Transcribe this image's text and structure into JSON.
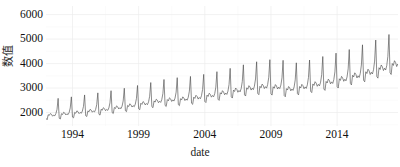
{
  "chart_data": {
    "type": "line",
    "title": "",
    "xlabel": "date",
    "ylabel": "数值",
    "xlim": [
      1992.0,
      2018.6
    ],
    "ylim": [
      1450,
      6350
    ],
    "grid": true,
    "legend": false,
    "legend_position": "none",
    "x_ticks": [
      "1994",
      "1999",
      "2004",
      "2009",
      "2014"
    ],
    "x_tick_values": [
      1994,
      1999,
      2004,
      2009,
      2014
    ],
    "y_ticks": [
      "2000",
      "3000",
      "4000",
      "5000",
      "6000"
    ],
    "y_tick_values": [
      2000,
      3000,
      4000,
      5000,
      6000
    ],
    "series": [
      {
        "name": "value",
        "color": "#4d4d4d",
        "x_start": 1992.0,
        "x_step": 0.08333333,
        "values": [
          1759,
          1706,
          1909,
          1887,
          1958,
          1925,
          1849,
          1896,
          1866,
          1960,
          2131,
          2579,
          1767,
          1736,
          1952,
          1917,
          2011,
          1979,
          1901,
          1948,
          1914,
          2005,
          2189,
          2640,
          1814,
          1784,
          2006,
          1970,
          2068,
          2036,
          1955,
          2004,
          1968,
          2062,
          2253,
          2718,
          1871,
          1839,
          2068,
          2030,
          2131,
          2096,
          2013,
          2064,
          2026,
          2123,
          2322,
          2803,
          1930,
          1896,
          2133,
          2093,
          2197,
          2160,
          2074,
          2127,
          2087,
          2188,
          2394,
          2892,
          1997,
          1961,
          2206,
          2165,
          2272,
          2233,
          2144,
          2199,
          2157,
          2262,
          2476,
          2992,
          2073,
          2035,
          2290,
          2246,
          2357,
          2317,
          2224,
          2281,
          2237,
          2346,
          2568,
          3105,
          2154,
          2114,
          2379,
          2333,
          2448,
          2406,
          2309,
          2368,
          2322,
          2435,
          2666,
          3224,
          2240,
          2198,
          2474,
          2426,
          2545,
          2501,
          2400,
          2461,
          2413,
          2530,
          2770,
          3350,
          2289,
          2247,
          2529,
          2480,
          2602,
          2557,
          2453,
          2516,
          2467,
          2586,
          2832,
          3424,
          2323,
          2280,
          2566,
          2517,
          2641,
          2595,
          2489,
          2553,
          2503,
          2624,
          2874,
          3474,
          2379,
          2335,
          2628,
          2577,
          2705,
          2658,
          2549,
          2615,
          2564,
          2688,
          2943,
          3558,
          2453,
          2407,
          2710,
          2657,
          2789,
          2740,
          2628,
          2696,
          2643,
          2771,
          3035,
          3669,
          2543,
          2496,
          2809,
          2755,
          2892,
          2841,
          2725,
          2795,
          2740,
          2873,
          3146,
          3804,
          2640,
          2591,
          2916,
          2859,
          3001,
          2949,
          2828,
          2901,
          2844,
          2982,
          3266,
          3948,
          2724,
          2674,
          3009,
          2951,
          3097,
          3043,
          2918,
          2993,
          2935,
          3077,
          3370,
          4073,
          2781,
          2729,
          3071,
          3012,
          3161,
          3106,
          2979,
          3056,
          2996,
          3141,
          3440,
          4158,
          2763,
          2712,
          3052,
          2993,
          3141,
          3086,
          2960,
          3036,
          2977,
          3121,
          3418,
          4132,
          2694,
          2644,
          2976,
          2919,
          3063,
          3010,
          2886,
          2961,
          2903,
          3044,
          3333,
          4030,
          2772,
          2721,
          3062,
          3003,
          3151,
          3096,
          2969,
          3046,
          2986,
          3131,
          3429,
          4145,
          2867,
          2814,
          3167,
          3106,
          3259,
          3202,
          3071,
          3150,
          3089,
          3238,
          3546,
          4287,
          2959,
          2904,
          3269,
          3206,
          3364,
          3305,
          3169,
          3251,
          3188,
          3342,
          3660,
          4425,
          3058,
          3001,
          3378,
          3313,
          3476,
          3415,
          3275,
          3359,
          3294,
          3454,
          3782,
          4572,
          3187,
          3127,
          3520,
          3453,
          3622,
          3559,
          3413,
          3501,
          3433,
          3599,
          3941,
          4765,
          3317,
          3255,
          3664,
          3593,
          3770,
          3704,
          3552,
          3644,
          3573,
          3746,
          4102,
          4960,
          3468,
          3404,
          3831,
          3757,
          3942,
          3873,
          3714,
          3810,
          3736,
          3917,
          4289,
          5186,
          3622,
          3554,
          4001,
          3923,
          4116,
          4044,
          3878,
          3978,
          3901,
          4090,
          4479,
          5415,
          3787,
          3716,
          4183,
          4103,
          4304,
          4228,
          4054,
          4159,
          4079,
          4276,
          4683,
          5661,
          3962,
          3888,
          4377,
          4292,
          4504,
          4424,
          4242,
          4352,
          4268,
          4475,
          4900,
          5924,
          4116,
          4039,
          4547,
          4459,
          4679,
          4595,
          4407,
          4521,
          4433,
          4648,
          5090,
          6154,
          4214,
          4135,
          4655,
          4565,
          4790,
          4704,
          4511,
          4628,
          4538,
          4758,
          5211,
          6300
        ]
      }
    ]
  }
}
